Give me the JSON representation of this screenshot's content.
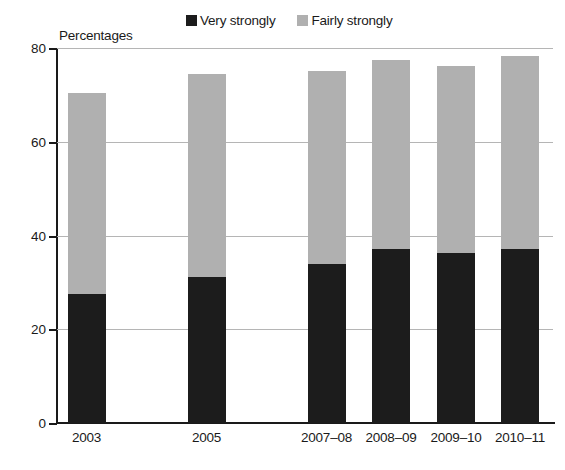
{
  "chart_data": {
    "type": "bar",
    "subtype": "stacked-bar",
    "title": "",
    "axis_note": "Percentages",
    "xlabel": "",
    "ylabel": "Percentages",
    "ylim": [
      0,
      80
    ],
    "yticks": [
      0,
      20,
      40,
      60,
      80
    ],
    "ytick_labels": [
      "0",
      "20",
      "40",
      "60",
      "80"
    ],
    "grid": true,
    "grid_axis": "y",
    "legend_position": "top-center",
    "categories": [
      "2003",
      "2005",
      "2007–08",
      "2008–09",
      "2009–10",
      "2010–11"
    ],
    "series": [
      {
        "name": "Very strongly",
        "color": "#1c1c1c",
        "values": [
          27.5,
          31.2,
          33.9,
          37.2,
          36.2,
          37.1
        ]
      },
      {
        "name": "Fairly strongly",
        "color": "#b0b0b0",
        "values": [
          43.0,
          43.2,
          41.3,
          40.2,
          40.0,
          41.1
        ]
      }
    ],
    "totals": [
      70.5,
      74.4,
      75.2,
      77.4,
      76.2,
      78.2
    ]
  },
  "legend": {
    "items": [
      {
        "label": "Very strongly",
        "color": "#1c1c1c"
      },
      {
        "label": "Fairly strongly",
        "color": "#b0b0b0"
      }
    ]
  },
  "colors": {
    "very_strongly": "#1c1c1c",
    "fairly_strongly": "#b0b0b0",
    "axis": "#1a1a1a",
    "grid": "#b5b5b5",
    "background": "#ffffff"
  }
}
